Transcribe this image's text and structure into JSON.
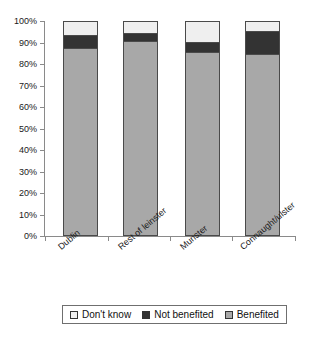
{
  "chart_data": {
    "type": "bar",
    "subtype": "stacked-100-percent",
    "title": "",
    "xlabel": "",
    "ylabel": "",
    "categories": [
      "Dublin",
      "Rest of leinster",
      "Munster",
      "Connaught/ulster"
    ],
    "series": [
      {
        "name": "Benefited",
        "color": "#a8a8a8",
        "values": [
          87,
          90,
          85,
          84
        ]
      },
      {
        "name": "Not benefited",
        "color": "#333333",
        "values": [
          6,
          4,
          5,
          11
        ]
      },
      {
        "name": "Don't know",
        "color": "#efefef",
        "values": [
          7,
          6,
          10,
          5
        ]
      }
    ],
    "stack_order_bottom_to_top": [
      "Benefited",
      "Not benefited",
      "Don't know"
    ],
    "ylim": [
      0,
      100
    ],
    "yticks": [
      "0%",
      "10%",
      "20%",
      "30%",
      "40%",
      "50%",
      "60%",
      "70%",
      "80%",
      "90%",
      "100%"
    ],
    "ytick_values": [
      0,
      10,
      20,
      30,
      40,
      50,
      60,
      70,
      80,
      90,
      100
    ],
    "grid": false,
    "legend_position": "bottom"
  },
  "axis": {
    "y_ticks": [
      {
        "label": "100%",
        "value": 100
      },
      {
        "label": "90%",
        "value": 90
      },
      {
        "label": "80%",
        "value": 80
      },
      {
        "label": "70%",
        "value": 70
      },
      {
        "label": "60%",
        "value": 60
      },
      {
        "label": "50%",
        "value": 50
      },
      {
        "label": "40%",
        "value": 40
      },
      {
        "label": "30%",
        "value": 30
      },
      {
        "label": "20%",
        "value": 20
      },
      {
        "label": "10%",
        "value": 10
      },
      {
        "label": "0%",
        "value": 0
      }
    ],
    "x_labels": [
      "Dublin",
      "Rest of leinster",
      "Munster",
      "Connaught/ulster"
    ]
  },
  "legend": {
    "items": [
      {
        "label": "Don't know",
        "color": "#efefef"
      },
      {
        "label": "Not benefited",
        "color": "#333333"
      },
      {
        "label": "Benefited",
        "color": "#a8a8a8"
      }
    ]
  },
  "colors": {
    "dont_know": "#efefef",
    "not_benefited": "#333333",
    "benefited": "#a8a8a8",
    "axis": "#8a8a8a",
    "text": "#1a1a1a",
    "background": "#ffffff"
  }
}
